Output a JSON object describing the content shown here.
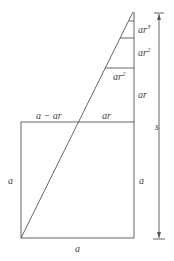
{
  "diagram": {
    "labels": {
      "ar3": "ar",
      "ar3_exp": "3",
      "ar2_right": "ar",
      "ar2_right_exp": "2",
      "ar2_inner": "ar",
      "ar2_inner_exp": "2",
      "ar_right": "ar",
      "a_minus_ar": "a − ar",
      "ar_top": "ar",
      "a_left": "a",
      "a_right": "a",
      "a_bottom": "a",
      "s": "s"
    },
    "colors": {
      "line": "#555555",
      "text": "#444444",
      "background": "#ffffff"
    }
  }
}
